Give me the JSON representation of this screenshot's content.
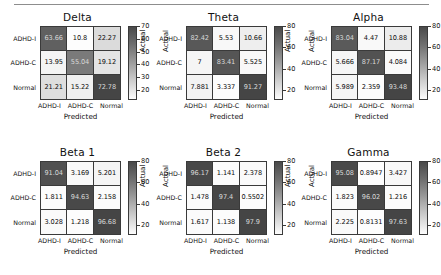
{
  "figure": {
    "axis_labels": {
      "x": "Predicted",
      "y": "Actual"
    },
    "class_labels": [
      "ADHD-I",
      "ADHD-C",
      "Normal"
    ],
    "colors": {
      "cell_min": "#fdfdfd",
      "cell_max": "#454545",
      "grid": "#3a3a3a"
    }
  },
  "chart_data": [
    {
      "type": "heatmap",
      "title": "Delta",
      "xlabel": "Predicted",
      "ylabel": "Actual",
      "categories": [
        "ADHD-I",
        "ADHD-C",
        "Normal"
      ],
      "rows": [
        "ADHD-I",
        "ADHD-C",
        "Normal"
      ],
      "values": [
        [
          63.66,
          10.8,
          22.27
        ],
        [
          13.95,
          55.04,
          19.12
        ],
        [
          21.21,
          15.22,
          72.78
        ]
      ],
      "cell_text": [
        [
          "63.66",
          "10.8",
          "22.27"
        ],
        [
          "13.95",
          "55.04",
          "19.12"
        ],
        [
          "21.21",
          "15.22",
          "72.78"
        ]
      ],
      "colorbar_ticks": [
        "70",
        "60",
        "50",
        "40",
        "30",
        "20"
      ],
      "clim": [
        15,
        75
      ],
      "grid": true,
      "legend": "colorbar-right"
    },
    {
      "type": "heatmap",
      "title": "Theta",
      "xlabel": "Predicted",
      "ylabel": "Actual",
      "categories": [
        "ADHD-I",
        "ADHD-C",
        "Normal"
      ],
      "rows": [
        "ADHD-I",
        "ADHD-C",
        "Normal"
      ],
      "values": [
        [
          82.42,
          5.53,
          10.66
        ],
        [
          7,
          83.41,
          5.525
        ],
        [
          7.881,
          3.337,
          91.27
        ]
      ],
      "cell_text": [
        [
          "82.42",
          "5.53",
          "10.66"
        ],
        [
          "7",
          "83.41",
          "5.525"
        ],
        [
          "7.881",
          "3.337",
          "91.27"
        ]
      ],
      "colorbar_ticks": [
        "80",
        "60",
        "40",
        "20"
      ],
      "clim": [
        3,
        92
      ],
      "grid": true,
      "legend": "colorbar-right"
    },
    {
      "type": "heatmap",
      "title": "Alpha",
      "xlabel": "Predicted",
      "ylabel": "Actual",
      "categories": [
        "ADHD-I",
        "ADHD-C",
        "Normal"
      ],
      "rows": [
        "ADHD-I",
        "ADHD-C",
        "Normal"
      ],
      "values": [
        [
          83.04,
          4.47,
          10.88
        ],
        [
          5.666,
          87.17,
          4.084
        ],
        [
          5.989,
          2.359,
          93.48
        ]
      ],
      "cell_text": [
        [
          "83.04",
          "4.47",
          "10.88"
        ],
        [
          "5.666",
          "87.17",
          "4.084"
        ],
        [
          "5.989",
          "2.359",
          "93.48"
        ]
      ],
      "colorbar_ticks": [
        "80",
        "60",
        "40",
        "20"
      ],
      "clim": [
        2,
        94
      ],
      "grid": true,
      "legend": "colorbar-right"
    },
    {
      "type": "heatmap",
      "title": "Beta 1",
      "xlabel": "Predicted",
      "ylabel": "Actual",
      "categories": [
        "ADHD-I",
        "ADHD-C",
        "Normal"
      ],
      "rows": [
        "ADHD-I",
        "ADHD-C",
        "Normal"
      ],
      "values": [
        [
          91.04,
          3.169,
          5.201
        ],
        [
          1.811,
          94.63,
          2.158
        ],
        [
          3.028,
          1.218,
          96.68
        ]
      ],
      "cell_text": [
        [
          "91.04",
          "3.169",
          "5.201"
        ],
        [
          "1.811",
          "94.63",
          "2.158"
        ],
        [
          "3.028",
          "1.218",
          "96.68"
        ]
      ],
      "colorbar_ticks": [
        "80",
        "60",
        "40",
        "20"
      ],
      "clim": [
        1,
        97
      ],
      "grid": true,
      "legend": "colorbar-right"
    },
    {
      "type": "heatmap",
      "title": "Beta 2",
      "xlabel": "Predicted",
      "ylabel": "Actual",
      "categories": [
        "ADHD-I",
        "ADHD-C",
        "Normal"
      ],
      "rows": [
        "ADHD-I",
        "ADHD-C",
        "Normal"
      ],
      "values": [
        [
          96.17,
          1.141,
          2.378
        ],
        [
          1.478,
          97.4,
          0.5502
        ],
        [
          1.617,
          1.138,
          97.9
        ]
      ],
      "cell_text": [
        [
          "96.17",
          "1.141",
          "2.378"
        ],
        [
          "1.478",
          "97.4",
          "0.5502"
        ],
        [
          "1.617",
          "1.138",
          "97.9"
        ]
      ],
      "colorbar_ticks": [
        "80",
        "60",
        "40",
        "20"
      ],
      "clim": [
        0.5,
        98
      ],
      "grid": true,
      "legend": "colorbar-right"
    },
    {
      "type": "heatmap",
      "title": "Gamma",
      "xlabel": "Predicted",
      "ylabel": "Actual",
      "categories": [
        "ADHD-I",
        "ADHD-C",
        "Normal"
      ],
      "rows": [
        "ADHD-I",
        "ADHD-C",
        "Normal"
      ],
      "values": [
        [
          95.08,
          0.8947,
          3.427
        ],
        [
          1.823,
          96.02,
          1.216
        ],
        [
          2.225,
          0.8131,
          97.63
        ]
      ],
      "cell_text": [
        [
          "95.08",
          "0.8947",
          "3.427"
        ],
        [
          "1.823",
          "96.02",
          "1.216"
        ],
        [
          "2.225",
          "0.8131",
          "97.63"
        ]
      ],
      "colorbar_ticks": [
        "80",
        "60",
        "40",
        "20"
      ],
      "clim": [
        0.8,
        98
      ],
      "grid": true,
      "legend": "colorbar-right"
    }
  ]
}
